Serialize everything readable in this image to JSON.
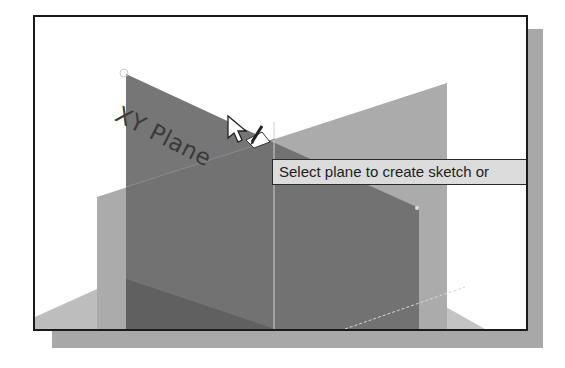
{
  "viewport": {
    "plane_label": "XY Plane",
    "tooltip": "Select plane to create sketch or"
  },
  "icons": {
    "cursor": "arrow-cursor-icon",
    "sketch": "pencil-sketch-icon"
  },
  "colors": {
    "frame_border": "#1a1a1a",
    "frame_shadow": "#a8a8a8",
    "xy_plane": "#6e6e6e",
    "yz_plane": "#a9a9a9",
    "xz_plane": "#b5b5b5",
    "tooltip_bg": "#dcdcdc"
  }
}
